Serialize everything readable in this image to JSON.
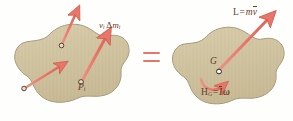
{
  "figure": {
    "name": "system-of-momenta-equivalence",
    "background_color": "#fefefd",
    "body_fill_color": "#cdc09a",
    "body_fill_light": "#ded3b4",
    "body_outline_color": "#9a8f72",
    "vector_color": "#e8776a",
    "vector_outline_color": "#c9594c",
    "label_color": "#6b3b2a",
    "equals_color": "#e8776a"
  },
  "left_body": {
    "name": "rigid-body-particle-momenta",
    "point_marker_label": "P",
    "point_marker_subscript": "i",
    "momentum_label": {
      "symbol": "v",
      "symbol_subscript": "i",
      "delta": "Δ",
      "mass": "m",
      "mass_subscript": "i",
      "full_text": "vᵢ Δmᵢ"
    },
    "vectors": [
      {
        "name": "momentum-vector-upper",
        "from": [
          62,
          44
        ],
        "to": [
          76,
          10
        ]
      },
      {
        "name": "momentum-vector-lower-left",
        "from": [
          25,
          88
        ],
        "to": [
          62,
          64
        ]
      },
      {
        "name": "momentum-vector-main",
        "from": [
          82,
          81
        ],
        "to": [
          108,
          33
        ]
      }
    ]
  },
  "equals": {
    "name": "equals-sign",
    "text": "="
  },
  "right_body": {
    "name": "rigid-body-resultant-momenta",
    "centroid_label": "G",
    "linear_momentum_label": {
      "symbol": "L",
      "equals": "=",
      "mass": "m",
      "velocity": "v",
      "velocity_overbar": true,
      "full_text": "L = mv̄"
    },
    "angular_momentum_label": {
      "symbol": "H",
      "symbol_subscript": "G",
      "equals": "=",
      "inertia": "I",
      "inertia_overbar": true,
      "omega": "ω",
      "full_text": "H_G = Īω"
    },
    "vectors": [
      {
        "name": "linear-momentum-vector",
        "from": [
          218,
          70
        ],
        "to": [
          268,
          18
        ]
      },
      {
        "name": "angular-momentum-arc",
        "type": "curved-arrow",
        "direction": "counterclockwise"
      }
    ]
  }
}
